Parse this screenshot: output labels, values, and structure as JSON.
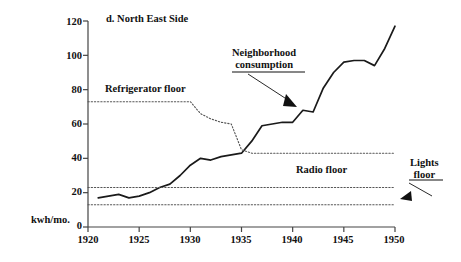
{
  "chart_data": {
    "type": "line",
    "title": "d. North East Side",
    "xlabel": "",
    "ylabel": "kwh/mo.",
    "xlim": [
      1920,
      1950
    ],
    "ylim": [
      0,
      120
    ],
    "xticks": [
      1920,
      1925,
      1930,
      1935,
      1940,
      1945,
      1950
    ],
    "yticks": [
      0,
      20,
      40,
      60,
      80,
      100,
      120
    ],
    "grid": false,
    "legend": "annotations",
    "series": [
      {
        "name": "Neighborhood consumption",
        "style": "solid",
        "x": [
          1921,
          1922,
          1923,
          1924,
          1925,
          1926,
          1927,
          1928,
          1929,
          1930,
          1931,
          1932,
          1933,
          1934,
          1935,
          1936,
          1937,
          1938,
          1939,
          1940,
          1941,
          1942,
          1943,
          1944,
          1945,
          1946,
          1947,
          1948,
          1949,
          1950
        ],
        "values": [
          17,
          18,
          19,
          17,
          18,
          20,
          23,
          25,
          30,
          36,
          40,
          39,
          41,
          42,
          43,
          50,
          59,
          60,
          61,
          61,
          68,
          67,
          81,
          90,
          96,
          97,
          97,
          94,
          104,
          117
        ]
      },
      {
        "name": "Refrigerator floor",
        "style": "dotted",
        "x": [
          1920,
          1929,
          1930,
          1931,
          1932,
          1933,
          1934,
          1935,
          1936,
          1950
        ],
        "values": [
          73,
          73,
          73,
          66,
          63,
          61,
          60,
          45,
          43,
          43
        ]
      },
      {
        "name": "Radio floor",
        "style": "dotted",
        "x": [
          1920,
          1950
        ],
        "values": [
          23,
          23
        ]
      },
      {
        "name": "Lights floor",
        "style": "dotted",
        "x": [
          1920,
          1950
        ],
        "values": [
          13,
          13
        ]
      }
    ],
    "annotations": [
      {
        "name": "neighborhood-consumption",
        "text_line1": "Neighborhood",
        "text_line2": "consumption",
        "underline": true,
        "arrow": true
      },
      {
        "name": "refrigerator-floor",
        "text_line1": "Refrigerator floor",
        "underline": false,
        "arrow": false
      },
      {
        "name": "radio-floor",
        "text_line1": "Radio floor",
        "underline": false,
        "arrow": false
      },
      {
        "name": "lights-floor",
        "text_line1": "Lights",
        "text_line2": "floor",
        "underline": true,
        "arrow": true
      }
    ],
    "colors": {
      "line": "#1a1a1a",
      "axis": "#444444",
      "dotted": "#555555",
      "text": "#111111"
    }
  },
  "axis": {
    "unit_label": "kwh/mo.",
    "y_ticks": [
      "120",
      "100",
      "80",
      "60",
      "40",
      "20",
      "0"
    ],
    "x_ticks": [
      "1920",
      "1925",
      "1930",
      "1935",
      "1940",
      "1945",
      "1950"
    ]
  },
  "title": {
    "text": "d. North East Side"
  },
  "annotations": {
    "neighborhood_l1": "Neighborhood",
    "neighborhood_l2": "consumption",
    "refrigerator": "Refrigerator floor",
    "radio": "Radio floor",
    "lights_l1": "Lights",
    "lights_l2": "floor"
  }
}
